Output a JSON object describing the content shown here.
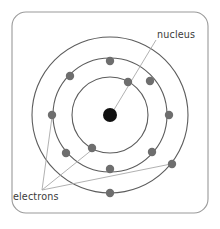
{
  "diagram": {
    "type": "atom-shell-diagram",
    "frame": {
      "shape": "rounded-rectangle",
      "stroke_color": "#9a9a9a",
      "fill_color": "#ffffff",
      "x": 12,
      "y": 12,
      "width": 196,
      "height": 201,
      "corner_radius": 14
    },
    "center": {
      "x": 110,
      "y": 115
    },
    "nucleus": {
      "label": "nucleus",
      "color": "#111111",
      "radius": 7,
      "cx": 110,
      "cy": 115
    },
    "electron_style": {
      "color": "#6e6e6e",
      "radius": 4.2
    },
    "orbit_style": {
      "stroke_color": "#5c5c5c",
      "stroke_width": 1.1,
      "fill": "none"
    },
    "leader_style": {
      "stroke_color": "#a8a8a8",
      "stroke_width": 0.9
    },
    "orbits": [
      {
        "name": "inner-shell",
        "radius": 38,
        "electron_count": 2,
        "electrons": [
          {
            "cx": 128,
            "cy": 82
          },
          {
            "cx": 92,
            "cy": 148
          }
        ]
      },
      {
        "name": "middle-shell",
        "radius": 57,
        "electron_count": 6,
        "electrons": [
          {
            "cx": 110,
            "cy": 61
          },
          {
            "cx": 70,
            "cy": 76
          },
          {
            "cx": 150,
            "cy": 81
          },
          {
            "cx": 66,
            "cy": 153
          },
          {
            "cx": 152,
            "cy": 152
          },
          {
            "cx": 110,
            "cy": 169
          }
        ]
      },
      {
        "name": "outer-shell",
        "radius": 78,
        "electron_count": 4,
        "electrons": [
          {
            "cx": 52,
            "cy": 115
          },
          {
            "cx": 169,
            "cy": 115
          },
          {
            "cx": 172,
            "cy": 164
          },
          {
            "cx": 110,
            "cy": 193
          }
        ]
      }
    ],
    "labels": {
      "nucleus": {
        "text": "nucleus",
        "x": 157,
        "y": 38,
        "anchor": "start",
        "leader": {
          "x1": 156,
          "y1": 40,
          "x2": 112,
          "y2": 113
        }
      },
      "electrons": {
        "text": "electrons",
        "x": 13,
        "y": 200,
        "anchor": "start",
        "leader_origin": {
          "x": 42,
          "y": 190
        },
        "leaders": [
          {
            "x1": 42,
            "y1": 190,
            "x2": 52,
            "y2": 117
          },
          {
            "x1": 42,
            "y1": 190,
            "x2": 93,
            "y2": 149
          },
          {
            "x1": 42,
            "y1": 190,
            "x2": 171,
            "y2": 164
          }
        ]
      }
    }
  }
}
